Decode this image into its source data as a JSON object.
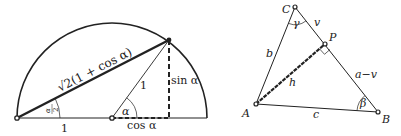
{
  "figures": [
    {
      "id": "half-angle-circle",
      "labels": {
        "chord": "√2(1 + cos α)",
        "radius": "1",
        "base_left": "1",
        "sin": "sin α",
        "cos": "cos α",
        "angle_alpha": "α",
        "half_angle_num": "α",
        "half_angle_den": "2"
      }
    },
    {
      "id": "triangle-altitude",
      "labels": {
        "vertex_A": "A",
        "vertex_B": "B",
        "vertex_C": "C",
        "foot_P": "P",
        "side_b": "b",
        "side_c": "c",
        "segment_v": "v",
        "segment_a_minus_v": "a−v",
        "altitude_h": "h",
        "angle_gamma": "γ",
        "angle_beta": "β"
      }
    }
  ],
  "colors": {
    "stroke": "#222222",
    "background": "#ffffff"
  }
}
